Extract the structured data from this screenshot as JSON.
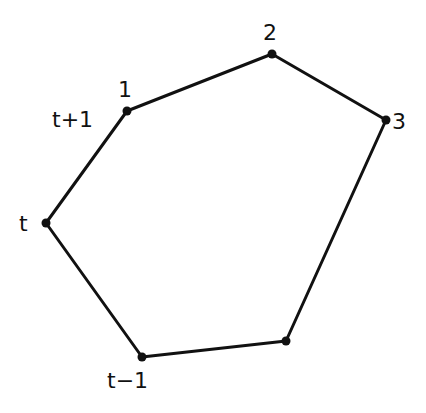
{
  "diagram": {
    "type": "polygon",
    "stroke_color": "#111111",
    "background": "#ffffff",
    "vertices": [
      {
        "id": "v1",
        "x": 127,
        "y": 111,
        "label": "1",
        "lx": 118,
        "ly": 97
      },
      {
        "id": "v2",
        "x": 272,
        "y": 54,
        "label": "2",
        "lx": 263,
        "ly": 40
      },
      {
        "id": "v3",
        "x": 386,
        "y": 120,
        "label": "3",
        "lx": 392,
        "ly": 129
      },
      {
        "id": "v4",
        "x": 286,
        "y": 341,
        "label": "",
        "lx": 0,
        "ly": 0
      },
      {
        "id": "vtm1",
        "x": 142,
        "y": 357,
        "label": "t−1",
        "lx": 107,
        "ly": 388
      },
      {
        "id": "vt",
        "x": 46,
        "y": 223,
        "label": "t",
        "lx": 19,
        "ly": 231
      }
    ],
    "extra_labels": [
      {
        "id": "tplus1",
        "text": "t+1",
        "x": 52,
        "y": 127
      }
    ]
  }
}
